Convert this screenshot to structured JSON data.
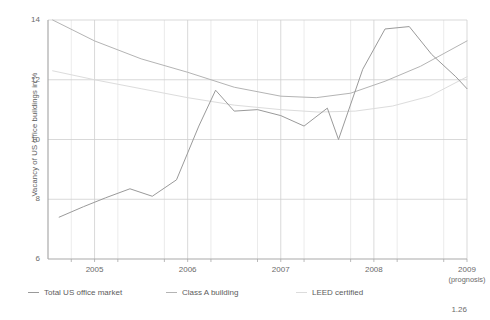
{
  "figure": {
    "number": "1.26"
  },
  "chart_data": {
    "type": "line",
    "title": "",
    "xlabel": "",
    "ylabel": "Vacancy of US office buildings in %",
    "xlim": [
      2004.5,
      2009.0
    ],
    "ylim": [
      6,
      14
    ],
    "yticks": [
      6,
      8,
      10,
      12,
      14
    ],
    "ytick_labels": [
      "6",
      "8",
      "10",
      "12",
      "14"
    ],
    "xticks": [
      2005,
      2006,
      2007,
      2008,
      2009
    ],
    "xtick_labels": [
      "2005",
      "2006",
      "2007",
      "2008",
      "2009"
    ],
    "xtick_sublabels": [
      "",
      "",
      "",
      "",
      "(prognosis)"
    ],
    "grid": true,
    "legend_position": "bottom",
    "minor_x_gridlines": [
      2004.75,
      2005.25,
      2005.75,
      2006.25,
      2006.75,
      2007.25,
      2007.75,
      2008.25,
      2008.75
    ],
    "series": [
      {
        "name": "Total US office market",
        "color": "#9a9a9a",
        "x": [
          2004.62,
          2004.88,
          2005.12,
          2005.38,
          2005.62,
          2005.88,
          2006.12,
          2006.3,
          2006.5,
          2006.75,
          2007.0,
          2007.25,
          2007.5,
          2007.62,
          2007.88,
          2008.12,
          2008.38,
          2008.62,
          2008.88,
          2009.0
        ],
        "values": [
          7.4,
          7.75,
          8.05,
          8.35,
          8.1,
          8.65,
          10.45,
          11.65,
          10.95,
          11.0,
          10.8,
          10.45,
          11.05,
          10.0,
          12.35,
          13.7,
          13.78,
          12.85,
          12.1,
          11.7
        ]
      },
      {
        "name": "Class A building",
        "color": "#b4b4b4",
        "x": [
          2004.55,
          2005.0,
          2005.5,
          2006.0,
          2006.5,
          2007.0,
          2007.38,
          2007.75,
          2008.12,
          2008.5,
          2009.0
        ],
        "values": [
          14.0,
          13.3,
          12.7,
          12.25,
          11.75,
          11.45,
          11.4,
          11.55,
          11.95,
          12.45,
          13.3
        ]
      },
      {
        "name": "LEED certified",
        "color": "#dcdcdc",
        "x": [
          2004.55,
          2005.0,
          2005.5,
          2006.0,
          2006.5,
          2007.0,
          2007.4,
          2007.8,
          2008.2,
          2008.6,
          2009.0
        ],
        "values": [
          12.3,
          12.0,
          11.7,
          11.4,
          11.15,
          11.0,
          10.92,
          10.95,
          11.12,
          11.45,
          12.1
        ]
      }
    ]
  }
}
